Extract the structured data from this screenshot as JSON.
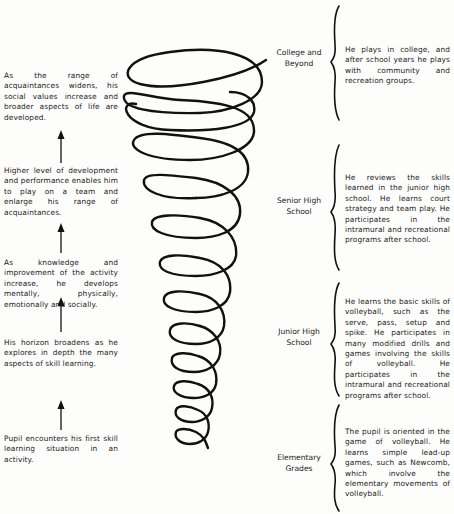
{
  "left_notes": [
    {
      "text": "As the range of acquaintances widens, his social values increase and broader aspects of life are developed."
    },
    {
      "text": "Higher level of development and performance enables him to play on a team and enlarge his range of acquaintances."
    },
    {
      "text": "As knowledge and improvement of the activity increase, he develops mentally, physically, emotionally and socially."
    },
    {
      "text": "His horizon broadens as he explores in depth the many aspects of skill learning."
    },
    {
      "text": "Pupil encounters his first skill learning situation in an activity."
    }
  ],
  "stages": [
    {
      "label": "College and Beyond",
      "description": "He plays in college, and after school years he plays with community and recreation groups."
    },
    {
      "label": "Senior High School",
      "description": "He reviews the skills learned in the junior high school. He learns court strategy and team play. He participates in the intramural and recreational programs after school."
    },
    {
      "label": "Junior High School",
      "description": "He learns the basic skills of volleyball, such as the serve, pass, setup and spike. He participates in many modified drills and games involving the skills of volleyball. He participates in the intramural and recreational programs after school."
    },
    {
      "label": "Elementary Grades",
      "description": "The pupil is oriented in the game of volleyball. He learns simple lead-up games, such as Newcomb, which involve the elementary movements of volleyball."
    }
  ],
  "graphics": {
    "spiral": "expanding-helix-icon",
    "arrow": "up-arrow-icon",
    "brace": "left-curly-brace-icon"
  }
}
